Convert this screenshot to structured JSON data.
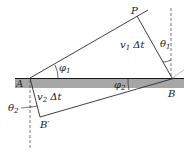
{
  "figure": {
    "type": "refraction-geometry",
    "points": {
      "A": {
        "label": "A",
        "x": 30,
        "y": 78
      },
      "B": {
        "label": "B",
        "x": 172,
        "y": 78
      },
      "P": {
        "label": "P",
        "x": 137,
        "y": 16
      },
      "B_prime": {
        "label": "B′",
        "x": 40,
        "y": 117
      }
    },
    "labels": {
      "P": "P",
      "A": "A",
      "B": "B",
      "B_prime": "B′",
      "v1dt_v": "v",
      "v1dt_sub": "1",
      "v1dt_rest": " Δt",
      "v2dt_v": "v",
      "v2dt_sub": "2",
      "v2dt_rest": " Δt",
      "theta1": "θ",
      "theta1_sub": "1",
      "theta2": "θ",
      "theta2_sub": "2",
      "phi1": "φ",
      "phi1_sub": "1",
      "phi2": "φ",
      "phi2_sub": "2"
    },
    "colors": {
      "interface_band": "#a6a6a6",
      "interface_line": "#1a1a1a",
      "lines": "#2a2a2a",
      "dashed": "#555555",
      "faint_line": "#bcbcbc"
    }
  }
}
